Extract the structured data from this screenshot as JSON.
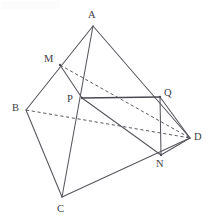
{
  "figure": {
    "canvas": {
      "width": 214,
      "height": 224,
      "background": "#ffffff"
    },
    "style": {
      "solid_stroke": "#55555c",
      "heavy_stroke": "#4a4a52",
      "dashed_stroke": "#5a5a62",
      "label_color": "#3d3d44",
      "solid_width": 1.05,
      "heavy_width": 1.5,
      "dashed_width": 1.0,
      "dash_pattern": "3.2 2.6"
    },
    "points": [
      {
        "id": "A",
        "label": "A",
        "x": 93,
        "y": 26,
        "label_x": 88,
        "label_y": 10,
        "dot": false
      },
      {
        "id": "B",
        "label": "B",
        "x": 26,
        "y": 110,
        "label_x": 12,
        "label_y": 103,
        "dot": false
      },
      {
        "id": "C",
        "label": "C",
        "x": 62,
        "y": 197,
        "label_x": 57,
        "label_y": 204,
        "dot": false
      },
      {
        "id": "D",
        "label": "D",
        "x": 190,
        "y": 138,
        "label_x": 194,
        "label_y": 132,
        "dot": false
      },
      {
        "id": "M",
        "label": "M",
        "x": 60,
        "y": 65,
        "label_x": 44,
        "label_y": 54,
        "dot": true
      },
      {
        "id": "N",
        "label": "N",
        "x": 161,
        "y": 155,
        "label_x": 156,
        "label_y": 159,
        "dot": true
      },
      {
        "id": "P",
        "label": "P",
        "x": 82,
        "y": 98,
        "label_x": 67,
        "label_y": 94,
        "dot": true
      },
      {
        "id": "Q",
        "label": "Q",
        "x": 160,
        "y": 97,
        "label_x": 164,
        "label_y": 88,
        "dot": true
      }
    ],
    "edges": [
      {
        "id": "AB",
        "from": "A",
        "to": "B",
        "kind": "solid",
        "name": "edge-a-b"
      },
      {
        "id": "AC",
        "from": "A",
        "to": "C",
        "kind": "solid",
        "name": "edge-a-c"
      },
      {
        "id": "AD",
        "from": "A",
        "to": "D",
        "kind": "solid",
        "name": "edge-a-d"
      },
      {
        "id": "BC",
        "from": "B",
        "to": "C",
        "kind": "solid",
        "name": "edge-b-c"
      },
      {
        "id": "CD",
        "from": "C",
        "to": "D",
        "kind": "solid",
        "name": "edge-c-d"
      },
      {
        "id": "BD",
        "from": "B",
        "to": "D",
        "kind": "dashed",
        "name": "edge-b-d-hidden"
      },
      {
        "id": "MD",
        "from": "M",
        "to": "D",
        "kind": "dashed",
        "name": "segment-m-d-hidden"
      },
      {
        "id": "MP",
        "from": "M",
        "to": "P",
        "kind": "solid",
        "name": "segment-m-p"
      },
      {
        "id": "PQ",
        "from": "P",
        "to": "Q",
        "kind": "heavy",
        "name": "segment-p-q"
      },
      {
        "id": "PN",
        "from": "P",
        "to": "N",
        "kind": "solid",
        "name": "segment-p-n"
      },
      {
        "id": "QN",
        "from": "Q",
        "to": "N",
        "kind": "solid",
        "name": "segment-q-n"
      },
      {
        "id": "QD",
        "from": "Q",
        "to": "D",
        "kind": "solid",
        "name": "segment-q-d"
      },
      {
        "id": "ND",
        "from": "N",
        "to": "D",
        "kind": "solid",
        "name": "segment-n-d"
      }
    ]
  }
}
